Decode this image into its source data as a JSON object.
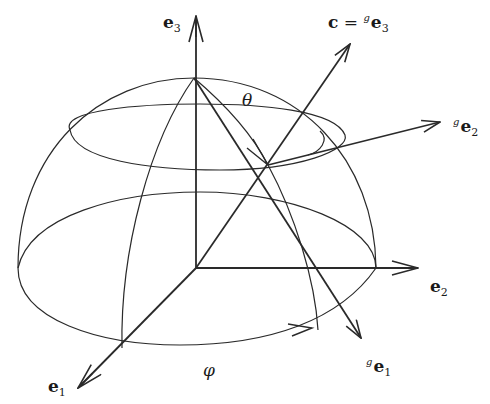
{
  "diagram": {
    "type": "hemisphere-with-rotated-frame",
    "colors": {
      "line": "#2a2a2a",
      "background": "#ffffff"
    },
    "axes": {
      "e1": {
        "base": "e",
        "sub": "1",
        "label": "e1"
      },
      "e2": {
        "base": "e",
        "sub": "2",
        "label": "e2"
      },
      "e3": {
        "base": "e",
        "sub": "3",
        "label": "e3"
      }
    },
    "rotated_axes": {
      "c": {
        "lhs": "c",
        "eq": " = ",
        "sup": "g",
        "base": "e",
        "sub": "3",
        "label": "c = ge3"
      },
      "ge1": {
        "sup": "g",
        "base": "e",
        "sub": "1",
        "label": "ge1"
      },
      "ge2": {
        "sup": "g",
        "base": "e",
        "sub": "2",
        "label": "ge2"
      }
    },
    "angles": {
      "theta": "θ",
      "phi": "φ"
    }
  }
}
